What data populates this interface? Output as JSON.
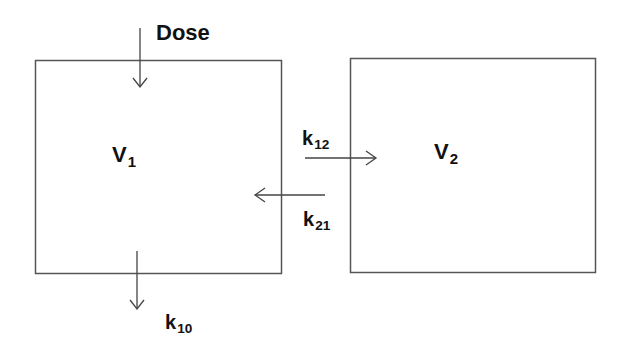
{
  "diagram": {
    "type": "two-compartment pharmacokinetic model",
    "compartments": [
      {
        "id": "central",
        "label_main": "V",
        "label_sub": "1"
      },
      {
        "id": "peripheral",
        "label_main": "V",
        "label_sub": "2"
      }
    ],
    "input": {
      "label": "Dose"
    },
    "rates": {
      "k12": {
        "main": "k",
        "sub": "12"
      },
      "k21": {
        "main": "k",
        "sub": "21"
      },
      "k10": {
        "main": "k",
        "sub": "10"
      }
    },
    "colors": {
      "line": "#555555",
      "text": "#111111",
      "background": "#ffffff"
    }
  }
}
